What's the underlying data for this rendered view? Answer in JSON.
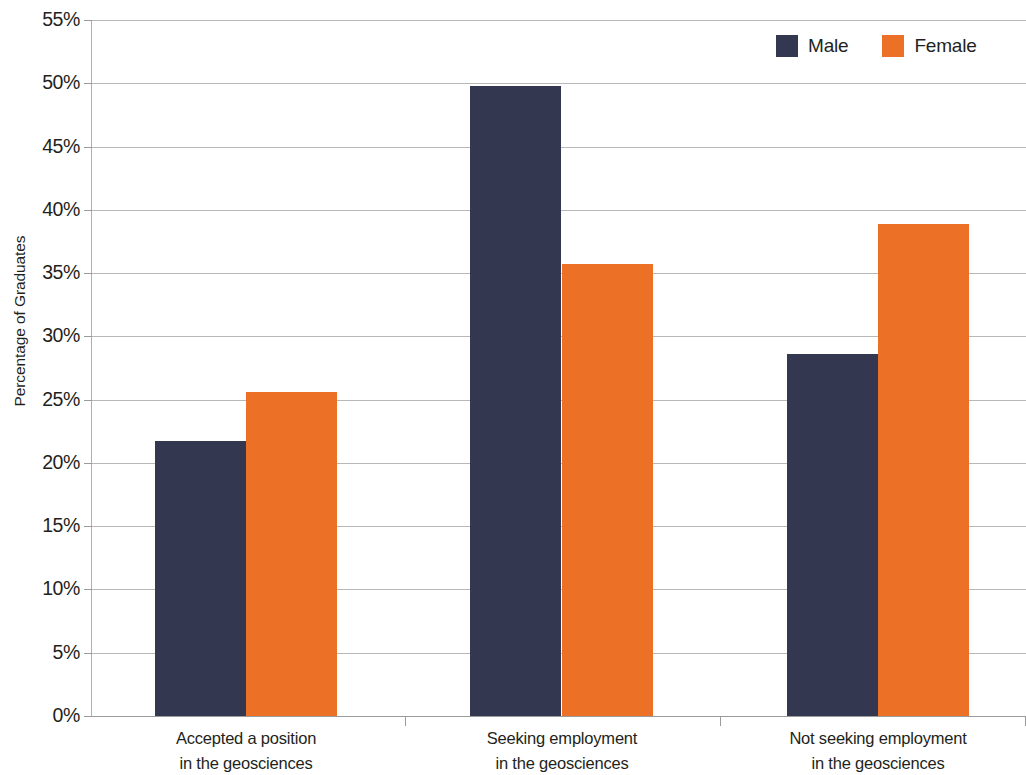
{
  "chart_data": {
    "type": "bar",
    "title": "",
    "xlabel": "",
    "ylabel": "Percentage of Graduates",
    "categories": [
      "Accepted a position\nin the geosciences",
      "Seeking employment\nin the geosciences",
      "Not seeking employment\nin the geosciences"
    ],
    "series": [
      {
        "name": "Male",
        "color": "#343750",
        "values": [
          21.7,
          49.8,
          28.6
        ]
      },
      {
        "name": "Female",
        "color": "#ec7025",
        "values": [
          25.6,
          35.7,
          38.9
        ]
      }
    ],
    "ylim": [
      0,
      55
    ],
    "ytick_labels": [
      "0%",
      "5%",
      "10%",
      "15%",
      "20%",
      "25%",
      "30%",
      "35%",
      "40%",
      "45%",
      "50%",
      "55%"
    ],
    "ytick_values": [
      0,
      5,
      10,
      15,
      20,
      25,
      30,
      35,
      40,
      45,
      50,
      55
    ],
    "grid": true,
    "legend_position": "top-right",
    "value_format": "percent"
  },
  "legend": {
    "items": [
      {
        "label": "Male",
        "swatch": "male-swatch"
      },
      {
        "label": "Female",
        "swatch": "female-swatch"
      }
    ]
  },
  "axis": {
    "y_title": "Percentage of Graduates"
  },
  "colors": {
    "male": "#343750",
    "female": "#ec7025",
    "gridline": "#b8b8b8",
    "axis": "#9a9a9a",
    "text": "#231f20",
    "background": "#ffffff"
  }
}
